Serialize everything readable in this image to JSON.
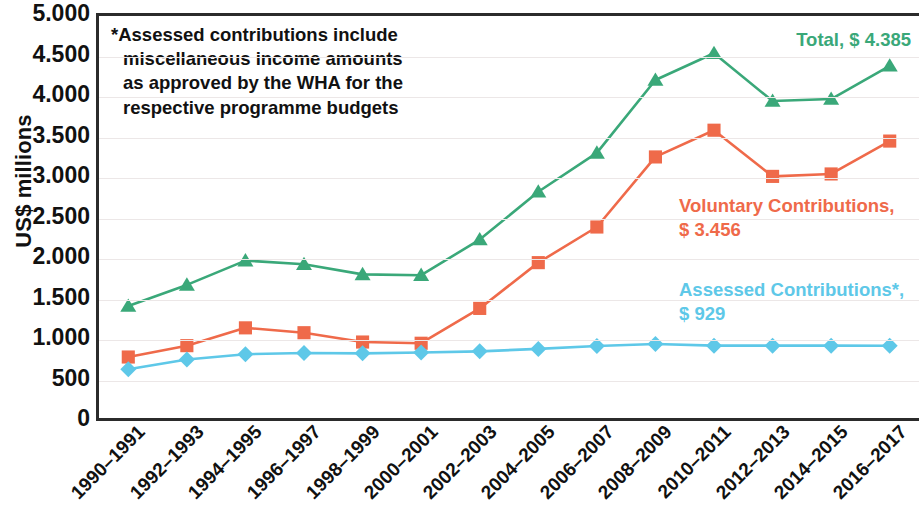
{
  "chart_data": {
    "type": "line",
    "title": "",
    "xlabel": "",
    "ylabel": "US$ millions",
    "ylim": [
      0,
      5000
    ],
    "ytick_values": [
      0,
      500,
      1000,
      1500,
      2000,
      2500,
      3000,
      3500,
      4000,
      4500,
      5000
    ],
    "ytick_labels": [
      "0",
      "500",
      "1.000",
      "1.500",
      "2.000",
      "2.500",
      "3.000",
      "3.500",
      "4.000",
      "4.500",
      "5.000"
    ],
    "grid": true,
    "legend_position": "right-inline",
    "categories": [
      "1990–1991",
      "1992–1993",
      "1994–1995",
      "1996–1997",
      "1998–1999",
      "2000–2001",
      "2002–2003",
      "2004–2005",
      "2006–2007",
      "2008–2009",
      "2010–2011",
      "2012–2013",
      "2014–2015",
      "2016–2017"
    ],
    "series": [
      {
        "name": "Total",
        "color": "#3aa879",
        "marker": "triangle",
        "values": [
          1420,
          1680,
          1980,
          1935,
          1810,
          1800,
          2240,
          2830,
          3310,
          4210,
          4540,
          3950,
          3975,
          4385
        ]
      },
      {
        "name": "Voluntary Contributions",
        "color": "#ef6a4a",
        "marker": "square",
        "values": [
          790,
          930,
          1150,
          1090,
          975,
          960,
          1390,
          1955,
          2395,
          3260,
          3590,
          3020,
          3050,
          3456
        ]
      },
      {
        "name": "Assessed Contributions*",
        "color": "#5ec8e8",
        "marker": "diamond",
        "values": [
          640,
          760,
          825,
          840,
          835,
          845,
          860,
          890,
          925,
          950,
          930,
          930,
          930,
          929
        ]
      }
    ]
  },
  "annotation": {
    "lines": [
      "*Assessed contributions include",
      "miscellaneous income amounts",
      "as approved by the WHA for the",
      "respective programme budgets"
    ]
  },
  "series_labels": {
    "total": {
      "line1": "Total, $ 4.385",
      "line2": "",
      "color": "#3aa879"
    },
    "voluntary": {
      "line1": "Voluntary Contributions,",
      "line2": "$ 3.456",
      "color": "#ef6a4a"
    },
    "assessed": {
      "line1": "Assessed Contributions*,",
      "line2": "$ 929",
      "color": "#5ec8e8"
    }
  },
  "axis": {
    "y_title": "US$ millions"
  }
}
